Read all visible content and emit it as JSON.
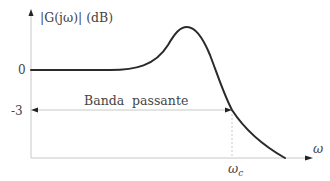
{
  "diagram": {
    "type": "bode-magnitude-plot",
    "y_axis_label": "|G(jω)| (dB)",
    "x_axis_label": "ω",
    "y_ticks": [
      {
        "label": "0",
        "value": 0
      },
      {
        "label": "-3",
        "value": -3
      }
    ],
    "x_marks": [
      {
        "label": "ω",
        "sub": "c",
        "meaning": "cutoff frequency"
      }
    ],
    "band_label": "Banda  passante",
    "colors": {
      "curve": "#2a2a2a",
      "axes": "#c8c8c8",
      "text": "#444444",
      "arrow": "#222222"
    }
  }
}
